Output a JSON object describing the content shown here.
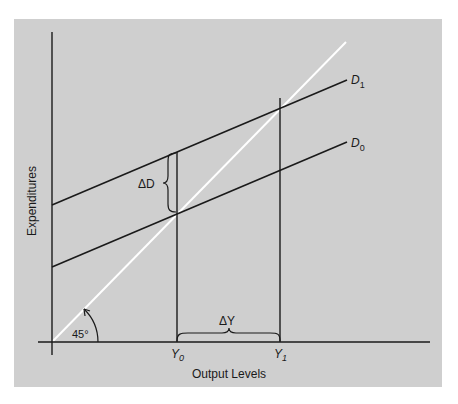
{
  "diagram": {
    "type": "keynesian-cross",
    "panel_color": "#cfcfcf",
    "line_color": "#1a1a1a",
    "reference_line_color": "#ffffff",
    "axes": {
      "x_label": "Output Levels",
      "y_label": "Expenditures"
    },
    "lines": {
      "d1_label": "D",
      "d1_sub": "1",
      "d0_label": "D",
      "d0_sub": "0",
      "reference_angle_label": "45°"
    },
    "markers": {
      "y0_label": "Y",
      "y0_sub": "0",
      "y1_label": "Y",
      "y1_sub": "1"
    },
    "annotations": {
      "delta_d": "ΔD",
      "delta_y": "ΔY"
    }
  }
}
